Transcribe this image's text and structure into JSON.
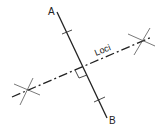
{
  "diagram": {
    "points": {
      "A": {
        "label": "A",
        "x": 57,
        "y": 12
      },
      "B": {
        "label": "B",
        "x": 107,
        "y": 118
      }
    },
    "locus_label": "Loci",
    "line_color": "#222222",
    "construction_color": "#555555"
  }
}
